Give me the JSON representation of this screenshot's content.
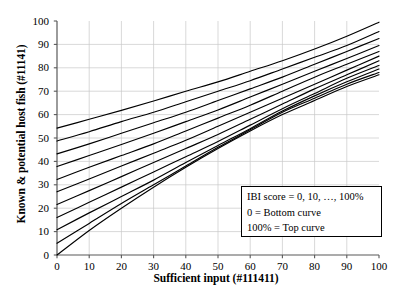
{
  "chart_data": {
    "type": "line",
    "title": "",
    "xlabel": "Sufficient input (#111411)",
    "ylabel": "Known & potential host fish (#11141)",
    "xlim": [
      0,
      100
    ],
    "ylim": [
      0,
      100
    ],
    "xticks": [
      0,
      10,
      20,
      30,
      40,
      50,
      60,
      70,
      80,
      90,
      100
    ],
    "yticks": [
      0,
      10,
      20,
      30,
      40,
      50,
      60,
      70,
      80,
      90,
      100
    ],
    "grid": true,
    "legend_position": "inside-lower-right",
    "annotations": [
      "IBI score = 0, 10, …, 100%",
      "0 = Bottom curve",
      "100% = Top curve"
    ],
    "series_label_key": "IBI score (%)",
    "series": [
      {
        "name": "0",
        "x": [
          0,
          10,
          20,
          30,
          40,
          50,
          60,
          70,
          80,
          90,
          100
        ],
        "values": [
          0,
          10.5,
          20.0,
          29.0,
          37.5,
          45.5,
          53.0,
          60.0,
          66.0,
          72.0,
          77.0
        ]
      },
      {
        "name": "10",
        "x": [
          0,
          10,
          20,
          30,
          40,
          50,
          60,
          70,
          80,
          90,
          100
        ],
        "values": [
          5.0,
          13.5,
          22.0,
          30.0,
          38.0,
          46.0,
          53.5,
          61.0,
          67.0,
          73.0,
          78.0
        ]
      },
      {
        "name": "20",
        "x": [
          0,
          10,
          20,
          30,
          40,
          50,
          60,
          70,
          80,
          90,
          100
        ],
        "values": [
          10.8,
          18.0,
          25.0,
          32.0,
          39.5,
          46.8,
          54.0,
          61.5,
          68.0,
          74.0,
          79.5
        ]
      },
      {
        "name": "30",
        "x": [
          0,
          10,
          20,
          30,
          40,
          50,
          60,
          70,
          80,
          90,
          100
        ],
        "values": [
          16.0,
          22.5,
          29.0,
          35.5,
          42.0,
          48.5,
          55.5,
          62.5,
          69.0,
          75.5,
          81.0
        ]
      },
      {
        "name": "40",
        "x": [
          0,
          10,
          20,
          30,
          40,
          50,
          60,
          70,
          80,
          90,
          100
        ],
        "values": [
          21.6,
          27.5,
          33.5,
          39.5,
          45.5,
          51.5,
          58.0,
          64.5,
          71.0,
          77.0,
          83.0
        ]
      },
      {
        "name": "50",
        "x": [
          0,
          10,
          20,
          30,
          40,
          50,
          60,
          70,
          80,
          90,
          100
        ],
        "values": [
          27.0,
          32.5,
          38.0,
          43.5,
          49.0,
          55.0,
          61.0,
          67.0,
          73.0,
          79.0,
          85.0
        ]
      },
      {
        "name": "60",
        "x": [
          0,
          10,
          20,
          30,
          40,
          50,
          60,
          70,
          80,
          90,
          100
        ],
        "values": [
          32.3,
          37.5,
          42.5,
          47.5,
          53.0,
          58.5,
          64.0,
          70.0,
          76.0,
          81.5,
          87.0
        ]
      },
      {
        "name": "70",
        "x": [
          0,
          10,
          20,
          30,
          40,
          50,
          60,
          70,
          80,
          90,
          100
        ],
        "values": [
          37.8,
          42.5,
          47.2,
          52.0,
          57.0,
          62.0,
          67.5,
          73.0,
          78.5,
          84.0,
          89.5
        ]
      },
      {
        "name": "80",
        "x": [
          0,
          10,
          20,
          30,
          40,
          50,
          60,
          70,
          80,
          90,
          100
        ],
        "values": [
          43.2,
          47.5,
          52.0,
          56.5,
          61.0,
          66.0,
          71.0,
          76.0,
          81.5,
          87.0,
          92.5
        ]
      },
      {
        "name": "90",
        "x": [
          0,
          10,
          20,
          30,
          40,
          50,
          60,
          70,
          80,
          90,
          100
        ],
        "values": [
          48.7,
          52.7,
          57.0,
          61.0,
          65.5,
          70.0,
          74.5,
          79.5,
          84.5,
          89.5,
          95.5
        ]
      },
      {
        "name": "100",
        "x": [
          0,
          10,
          20,
          30,
          40,
          50,
          60,
          70,
          80,
          90,
          100
        ],
        "values": [
          54.2,
          58.0,
          61.8,
          65.8,
          70.0,
          74.0,
          78.5,
          83.0,
          88.0,
          93.5,
          99.5
        ]
      }
    ]
  },
  "axes": {
    "xlabel": "Sufficient input (#111411)",
    "ylabel": "Known & potential host fish (#11141)",
    "xtick_labels": [
      "0",
      "10",
      "20",
      "30",
      "40",
      "50",
      "60",
      "70",
      "80",
      "90",
      "100"
    ],
    "ytick_labels": [
      "0",
      "10",
      "20",
      "30",
      "40",
      "50",
      "60",
      "70",
      "80",
      "90",
      "100"
    ]
  },
  "legend": {
    "line1": "IBI score = 0, 10, …, 100%",
    "line2": "0 = Bottom curve",
    "line3": "100% = Top curve"
  },
  "colors": {
    "curve": "#000000",
    "axis": "#595959",
    "grid": "#c8c8c8",
    "background": "#ffffff"
  }
}
